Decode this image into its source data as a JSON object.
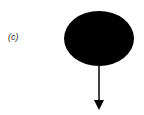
{
  "diagram": {
    "panel_label": "(c)",
    "node": {
      "shape": "ellipse",
      "fill": "#000000",
      "cx": 99,
      "cy": 38.5,
      "rx": 35,
      "ry": 27.5
    },
    "edge": {
      "direction": "down",
      "color": "#000000",
      "x": 99,
      "y1": 66,
      "y2": 110
    }
  }
}
